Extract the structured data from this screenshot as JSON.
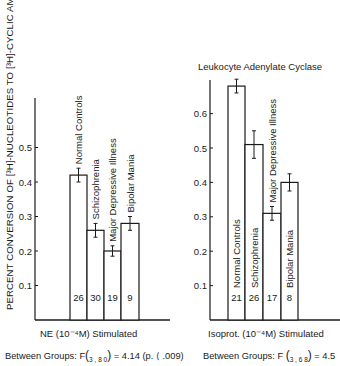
{
  "figure": {
    "ylabel": "PERCENT CONVERSION OF [³H]-NUCLEOTIDES TO [³H]-CYCLIC AMP",
    "right_title": "Leukocyte Adenylate Cyclase"
  },
  "chart_data": [
    {
      "type": "bar",
      "title": "",
      "xlabel": "NE (10⁻⁴M) Stimulated",
      "ylabel": "PERCENT CONVERSION OF [³H]-NUCLEOTIDES TO [³H]-CYCLIC AMP",
      "ylim": [
        0,
        0.6
      ],
      "yticks": [
        "0.1",
        "0.2",
        "0.3",
        "0.4",
        "0.5"
      ],
      "categories": [
        "Normal Controls",
        "Schizophrenia",
        "Major Depressive Illness",
        "Bipolar Mania"
      ],
      "values": [
        0.42,
        0.26,
        0.2,
        0.28
      ],
      "error": [
        0.02,
        0.02,
        0.015,
        0.02
      ],
      "n": [
        "26",
        "30",
        "19",
        "9"
      ],
      "stats": "Between Groups: F(3,80) = 4.14 (p. < .009)",
      "grid": false
    },
    {
      "type": "bar",
      "title": "Leukocyte Adenylate Cyclase",
      "xlabel": "Isoprot. (10⁻⁴M) Stimulated",
      "ylabel": "",
      "ylim": [
        0,
        0.7
      ],
      "yticks": [
        "0.1",
        "0.2",
        "0.3",
        "0.4",
        "0.5",
        "0.6"
      ],
      "categories": [
        "Normal Controls",
        "Schizophrenia",
        "Major Depressive Illness",
        "Bipolar Mania"
      ],
      "values": [
        0.68,
        0.51,
        0.31,
        0.4
      ],
      "error": [
        0.02,
        0.04,
        0.02,
        0.025
      ],
      "n": [
        "21",
        "26",
        "17",
        "8"
      ],
      "stats": "Between Groups: F(3,68) = 4.5",
      "grid": false
    }
  ],
  "left": {
    "xlabel": "NE (10⁻⁴M) Stimulated",
    "stats_prefix": "Between Groups: F",
    "stats_sub": "3 , 8 0",
    "stats_suffix": " = 4.14 (p. ⟨ .009)"
  },
  "right": {
    "xlabel": "Isoprot. (10⁻⁴M) Stimulated",
    "stats_prefix": "Between Groups: F ",
    "stats_sub": "3 , 6 8",
    "stats_suffix": " = 4.5"
  }
}
